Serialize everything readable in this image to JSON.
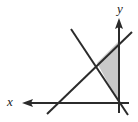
{
  "figure": {
    "name": "coordinate-axes-shaded-triangle-diagram",
    "background_color": "#ffffff",
    "width": 138,
    "height": 122,
    "line_color": "#2b2b2b",
    "shade_color": "#c8c8c8",
    "shade_stroke_color": "#9a9a9a"
  },
  "axes": {
    "origin": {
      "x": 119,
      "y": 103
    },
    "x_axis": {
      "label": "x",
      "label_position": {
        "x": 10,
        "y": 101
      },
      "direction": "left",
      "arrow_tip": {
        "x": 22,
        "y": 103
      },
      "tail": {
        "x": 129,
        "y": 103
      },
      "stroke_width": 2
    },
    "y_axis": {
      "label": "y",
      "label_position": {
        "x": 119,
        "y": 9
      },
      "direction": "up",
      "arrow_tip": {
        "x": 119,
        "y": 18
      },
      "tail": {
        "x": 119,
        "y": 113
      },
      "stroke_width": 2
    }
  },
  "lines": [
    {
      "name": "ascending-line",
      "slope_sign": "positive",
      "start": {
        "x": 47,
        "y": 114
      },
      "end": {
        "x": 132,
        "y": 32
      },
      "stroke_width": 2
    },
    {
      "name": "descending-line",
      "slope_sign": "negative",
      "start": {
        "x": 71,
        "y": 29
      },
      "end": {
        "x": 128,
        "y": 115
      },
      "stroke_width": 2
    }
  ],
  "shaded_region": {
    "name": "shaded-triangle",
    "fill": "#c8c8c8",
    "vertices": [
      {
        "x": 119,
        "y": 41
      },
      {
        "x": 97,
        "y": 63
      },
      {
        "x": 119,
        "y": 103
      }
    ],
    "points_path": "119,41 97,63 119,103"
  }
}
